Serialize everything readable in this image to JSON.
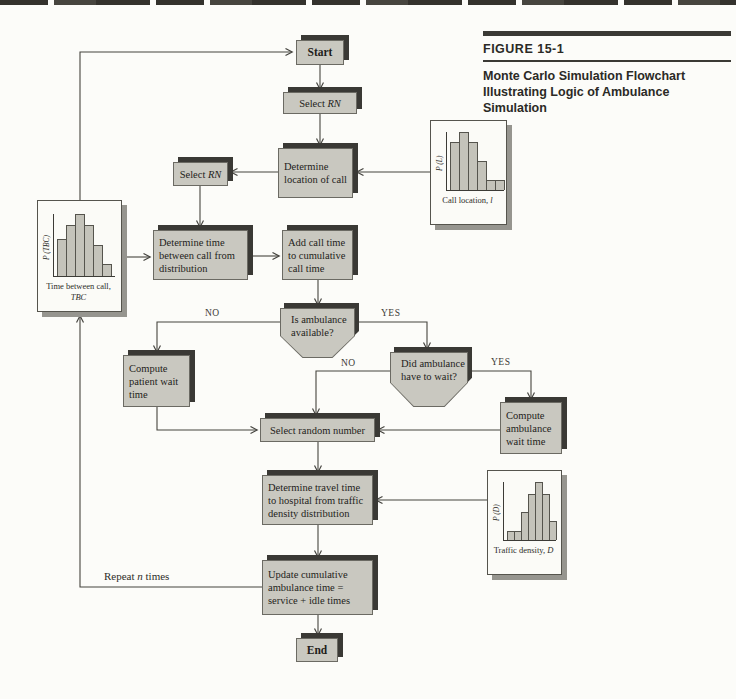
{
  "figure": {
    "label": "FIGURE 15-1",
    "title_line1": "Monte Carlo Simulation Flowchart",
    "title_line2": "Illustrating Logic of Ambulance Simulation"
  },
  "nodes": {
    "start": {
      "text": "Start"
    },
    "select_rn_top": {
      "prefix": "Select ",
      "em": "RN"
    },
    "determine_location": {
      "text": "Determine location of call"
    },
    "select_rn_left": {
      "prefix": "Select ",
      "em": "RN"
    },
    "determine_time": {
      "text": "Determine time between call from distribution"
    },
    "add_call_time": {
      "text": "Add call time to cumulative call time"
    },
    "is_ambulance_available": {
      "line1": "Is ambulance",
      "line2": "available?"
    },
    "compute_patient": {
      "text": "Compute patient wait time"
    },
    "did_ambulance_wait": {
      "line1": "Did ambulance",
      "line2": "have to wait?"
    },
    "compute_ambulance": {
      "text": "Compute ambulance wait time"
    },
    "select_random_number": {
      "text": "Select random number"
    },
    "determine_travel": {
      "text": "Determine travel time to hospital from traffic density distribution"
    },
    "update_cumulative": {
      "text": "Update cumulative ambulance  time = service + idle times"
    },
    "end": {
      "text": "End"
    }
  },
  "labels": {
    "decision1_no": "NO",
    "decision1_yes": "YES",
    "decision2_no": "NO",
    "decision2_yes": "YES",
    "repeat": {
      "prefix": "Repeat ",
      "em": "n",
      "suffix": " times"
    }
  },
  "chart_data": [
    {
      "type": "bar",
      "name": "time-between-calls-distribution",
      "ylabel": "P (TBC)",
      "xlabel_prefix": "Time between call, ",
      "xlabel_em": "TBC",
      "values": [
        0.6,
        0.82,
        1.0,
        0.82,
        0.5,
        0.2
      ],
      "ylim": [
        0,
        1
      ],
      "grid": false
    },
    {
      "type": "bar",
      "name": "call-location-distribution",
      "ylabel": "P (L)",
      "xlabel_prefix": "Call location, ",
      "xlabel_em": "l",
      "values": [
        0.82,
        1.0,
        0.82,
        0.5,
        0.18,
        0.18
      ],
      "ylim": [
        0,
        1
      ],
      "grid": false
    },
    {
      "type": "bar",
      "name": "traffic-density-distribution",
      "ylabel": "P (D)",
      "xlabel_prefix": "Traffic density, ",
      "xlabel_em": "D",
      "values": [
        0.15,
        0.15,
        0.48,
        0.8,
        1.0,
        0.8,
        0.32
      ],
      "ylim": [
        0,
        1
      ],
      "grid": false
    }
  ],
  "colors": {
    "node_fill": "#c9c8c0",
    "node_shadow": "#3a3935",
    "wire": "#45443f",
    "card_shadow": "#96958f"
  }
}
